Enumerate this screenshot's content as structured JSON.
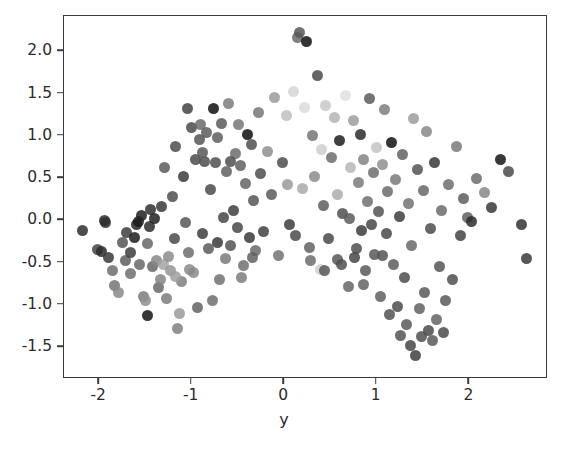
{
  "figure": {
    "background_color": "#ffffff",
    "axes_color": "#3b3b3b",
    "tick_text_color": "#2b2b2b"
  },
  "axes": {
    "xlabel": "y",
    "ylabel": "",
    "title": "",
    "x_ticks": [
      "-2",
      "-1",
      "0",
      "1",
      "2"
    ],
    "x_tick_values": [
      -2,
      -1,
      0,
      1,
      2
    ],
    "y_ticks": [
      "2.0",
      "1.5",
      "1.0",
      "0.5",
      "0.0",
      "-0.5",
      "-1.0",
      "-1.5"
    ],
    "y_tick_values": [
      2.0,
      1.5,
      1.0,
      0.5,
      0.0,
      -0.5,
      -1.0,
      -1.5
    ]
  },
  "chart_data": {
    "type": "scatter",
    "title": "",
    "xlabel": "y",
    "ylabel": "",
    "xlim": [
      -2.38,
      2.85
    ],
    "ylim": [
      -1.88,
      2.42
    ],
    "grid": false,
    "legend": null,
    "marker": {
      "shape": "circle",
      "size_px": 11,
      "colormap": "gray",
      "alpha": 0.85
    },
    "series": [
      {
        "name": "points",
        "points": [
          [
            -2.18,
            -0.12,
            "#2e2e2e"
          ],
          [
            -2.02,
            -0.35,
            "#444444"
          ],
          [
            -1.97,
            -0.37,
            "#2a2a2a"
          ],
          [
            -1.93,
            -0.03,
            "#303030"
          ],
          [
            -1.9,
            -0.44,
            "#3a3a3a"
          ],
          [
            -1.86,
            -0.6,
            "#6d6d6d"
          ],
          [
            -1.83,
            -0.77,
            "#767676"
          ],
          [
            -1.79,
            -0.86,
            "#8a8a8a"
          ],
          [
            -1.75,
            -0.26,
            "#555555"
          ],
          [
            -1.72,
            -0.48,
            "#5e5e5e"
          ],
          [
            -1.7,
            -0.14,
            "#3d3d3d"
          ],
          [
            -1.66,
            -0.63,
            "#707070"
          ],
          [
            -1.62,
            -0.2,
            "#1d1d1d"
          ],
          [
            -1.6,
            -0.05,
            "#262626"
          ],
          [
            -1.58,
            -0.02,
            "#1a1a1a"
          ],
          [
            -1.56,
            -0.52,
            "#686868"
          ],
          [
            -1.54,
            0.06,
            "#202020"
          ],
          [
            -1.52,
            -0.9,
            "#7d7d7d"
          ],
          [
            -1.5,
            -0.95,
            "#8f8f8f"
          ],
          [
            -1.48,
            -1.13,
            "#141414"
          ],
          [
            -1.46,
            -0.07,
            "#2c2c2c"
          ],
          [
            -1.44,
            0.13,
            "#2f2f2f"
          ],
          [
            -1.42,
            -0.55,
            "#676767"
          ],
          [
            -1.4,
            0.02,
            "#222222"
          ],
          [
            -1.38,
            -0.48,
            "#878787"
          ],
          [
            -1.36,
            -0.8,
            "#6a6a6a"
          ],
          [
            -1.33,
            0.16,
            "#393939"
          ],
          [
            -1.31,
            -0.52,
            "#a4a4a4"
          ],
          [
            -1.29,
            0.62,
            "#5a5a5a"
          ],
          [
            -1.27,
            -0.93,
            "#7b7b7b"
          ],
          [
            -1.25,
            -0.43,
            "#8d8d8d"
          ],
          [
            -1.23,
            -0.6,
            "#959595"
          ],
          [
            -1.21,
            0.28,
            "#4e4e4e"
          ],
          [
            -1.19,
            -0.22,
            "#4a4a4a"
          ],
          [
            -1.17,
            0.87,
            "#4d4d4d"
          ],
          [
            -1.15,
            -1.28,
            "#808080"
          ],
          [
            -1.13,
            -1.1,
            "#9a9a9a"
          ],
          [
            -1.11,
            -0.72,
            "#7f7f7f"
          ],
          [
            -1.09,
            0.52,
            "#3c3c3c"
          ],
          [
            -1.07,
            -0.03,
            "#575757"
          ],
          [
            -1.05,
            1.32,
            "#434343"
          ],
          [
            -1.03,
            -0.38,
            "#6f6f6f"
          ],
          [
            -1.0,
            1.1,
            "#4c4c4c"
          ],
          [
            -0.98,
            -0.62,
            "#8b8b8b"
          ],
          [
            -0.96,
            0.72,
            "#4b4b4b"
          ],
          [
            -0.94,
            -1.03,
            "#636363"
          ],
          [
            -0.92,
            0.96,
            "#565656"
          ],
          [
            -0.9,
            1.13,
            "#6b6b6b"
          ],
          [
            -0.88,
            -0.16,
            "#3e3e3e"
          ],
          [
            -0.86,
            0.7,
            "#4f4f4f"
          ],
          [
            -0.84,
            1.04,
            "#5d5d5d"
          ],
          [
            -0.82,
            -0.33,
            "#5c5c5c"
          ],
          [
            -0.8,
            0.37,
            "#4a4a4a"
          ],
          [
            -0.78,
            -0.95,
            "#6e6e6e"
          ],
          [
            -0.76,
            1.33,
            "#111111"
          ],
          [
            -0.74,
            0.69,
            "#515151"
          ],
          [
            -0.72,
            -0.26,
            "#3b3b3b"
          ],
          [
            -0.7,
            -0.7,
            "#727272"
          ],
          [
            -0.68,
            1.15,
            "#5b5b5b"
          ],
          [
            -0.66,
            0.03,
            "#474747"
          ],
          [
            -0.64,
            -0.45,
            "#7a7a7a"
          ],
          [
            -0.62,
            0.58,
            "#606060"
          ],
          [
            -0.6,
            1.38,
            "#7c7c7c"
          ],
          [
            -0.58,
            -0.3,
            "#545454"
          ],
          [
            -0.55,
            0.12,
            "#3f3f3f"
          ],
          [
            -0.53,
            0.79,
            "#6c6c6c"
          ],
          [
            -0.51,
            -0.08,
            "#484848"
          ],
          [
            -0.49,
            1.14,
            "#757575"
          ],
          [
            -0.47,
            0.65,
            "#5f5f5f"
          ],
          [
            -0.44,
            -0.53,
            "#717171"
          ],
          [
            -0.42,
            0.44,
            "#646464"
          ],
          [
            -0.4,
            1.02,
            "#0e0e0e"
          ],
          [
            -0.38,
            -0.2,
            "#3a3a3a"
          ],
          [
            -0.35,
            0.9,
            "#505050"
          ],
          [
            -0.33,
            0.24,
            "#565656"
          ],
          [
            -0.31,
            -0.36,
            "#6a6a6a"
          ],
          [
            -0.28,
            1.28,
            "#777777"
          ],
          [
            -0.26,
            0.55,
            "#4d4d4d"
          ],
          [
            -0.22,
            -0.13,
            "#424242"
          ],
          [
            -0.18,
            0.82,
            "#8e8e8e"
          ],
          [
            -0.14,
            0.3,
            "#5a5a5a"
          ],
          [
            -0.1,
            1.45,
            "#9b9b9b"
          ],
          [
            -0.06,
            -0.42,
            "#737373"
          ],
          [
            -0.02,
            0.68,
            "#4e4e4e"
          ],
          [
            0.02,
            1.24,
            "#c0c0c0"
          ],
          [
            0.06,
            -0.05,
            "#3d3d3d"
          ],
          [
            0.1,
            1.52,
            "#d6d6d6"
          ],
          [
            0.14,
            2.16,
            "#6b6b6b"
          ],
          [
            0.17,
            2.22,
            "#575757"
          ],
          [
            0.2,
            0.38,
            "#a9a9a9"
          ],
          [
            0.24,
            2.12,
            "#121212"
          ],
          [
            0.27,
            -0.32,
            "#636363"
          ],
          [
            0.3,
            1.0,
            "#757575"
          ],
          [
            0.33,
            0.52,
            "#8c8c8c"
          ],
          [
            0.36,
            1.72,
            "#4b4b4b"
          ],
          [
            0.39,
            -0.58,
            "#cfcfcf"
          ],
          [
            0.42,
            0.18,
            "#5e5e5e"
          ],
          [
            0.45,
            1.36,
            "#c8c8c8"
          ],
          [
            0.48,
            -0.22,
            "#4a4a4a"
          ],
          [
            0.51,
            0.74,
            "#6d6d6d"
          ],
          [
            0.54,
            1.22,
            "#b4b4b4"
          ],
          [
            0.57,
            -0.47,
            "#585858"
          ],
          [
            0.6,
            0.95,
            "#1f1f1f"
          ],
          [
            0.63,
            0.08,
            "#505050"
          ],
          [
            0.66,
            1.48,
            "#e0e0e0"
          ],
          [
            0.69,
            -0.78,
            "#666666"
          ],
          [
            0.72,
            0.62,
            "#b9b9b9"
          ],
          [
            0.75,
            1.18,
            "#9d9d9d"
          ],
          [
            0.78,
            -0.34,
            "#4f4f4f"
          ],
          [
            0.8,
            0.45,
            "#7b7b7b"
          ],
          [
            0.82,
            1.02,
            "#2b2b2b"
          ],
          [
            0.84,
            -0.12,
            "#3c3c3c"
          ],
          [
            0.86,
            0.72,
            "#848484"
          ],
          [
            0.88,
            -0.6,
            "#5b5b5b"
          ],
          [
            0.9,
            0.22,
            "#707070"
          ],
          [
            0.92,
            1.44,
            "#5c5c5c"
          ],
          [
            0.94,
            -0.05,
            "#464646"
          ],
          [
            0.96,
            0.57,
            "#6e6e6e"
          ],
          [
            0.98,
            -0.4,
            "#595959"
          ],
          [
            1.0,
            0.86,
            "#c3c3c3"
          ],
          [
            1.02,
            0.1,
            "#535353"
          ],
          [
            1.04,
            -0.9,
            "#5f5f5f"
          ],
          [
            1.06,
            0.66,
            "#8f8f8f"
          ],
          [
            1.08,
            1.31,
            "#7e7e7e"
          ],
          [
            1.1,
            -0.16,
            "#494949"
          ],
          [
            1.12,
            0.34,
            "#6b6b6b"
          ],
          [
            1.14,
            -1.12,
            "#525252"
          ],
          [
            1.16,
            0.92,
            "#111111"
          ],
          [
            1.18,
            -0.52,
            "#5d5d5d"
          ],
          [
            1.2,
            0.48,
            "#797979"
          ],
          [
            1.22,
            -1.02,
            "#4c4c4c"
          ],
          [
            1.24,
            0.04,
            "#3e3e3e"
          ],
          [
            1.26,
            -1.36,
            "#555555"
          ],
          [
            1.28,
            0.78,
            "#626262"
          ],
          [
            1.3,
            -0.68,
            "#4d4d4d"
          ],
          [
            1.32,
            -1.24,
            "#5a5a5a"
          ],
          [
            1.34,
            0.2,
            "#737373"
          ],
          [
            1.36,
            -1.48,
            "#474747"
          ],
          [
            1.38,
            -0.3,
            "#6a6a6a"
          ],
          [
            1.4,
            1.2,
            "#9c9c9c"
          ],
          [
            1.42,
            -1.6,
            "#3f3f3f"
          ],
          [
            1.44,
            0.6,
            "#545454"
          ],
          [
            1.46,
            -1.05,
            "#606060"
          ],
          [
            1.48,
            -1.38,
            "#515151"
          ],
          [
            1.5,
            0.35,
            "#676767"
          ],
          [
            1.52,
            -0.85,
            "#585858"
          ],
          [
            1.54,
            1.05,
            "#888888"
          ],
          [
            1.56,
            -1.3,
            "#4a4a4a"
          ],
          [
            1.58,
            -0.1,
            "#4e4e4e"
          ],
          [
            1.6,
            -1.42,
            "#5b5b5b"
          ],
          [
            1.62,
            0.68,
            "#383838"
          ],
          [
            1.64,
            -1.18,
            "#636363"
          ],
          [
            1.68,
            -0.55,
            "#565656"
          ],
          [
            1.7,
            0.12,
            "#6c6c6c"
          ],
          [
            1.72,
            -1.33,
            "#4b4b4b"
          ],
          [
            1.74,
            -0.95,
            "#595959"
          ],
          [
            1.78,
            0.42,
            "#6f6f6f"
          ],
          [
            1.82,
            -0.7,
            "#4f4f4f"
          ],
          [
            1.86,
            0.88,
            "#7a7a7a"
          ],
          [
            1.9,
            -0.18,
            "#444444"
          ],
          [
            1.94,
            0.26,
            "#5e5e5e"
          ],
          [
            1.98,
            0.03,
            "#616161"
          ],
          [
            2.02,
            -0.02,
            "#2d2d2d"
          ],
          [
            2.08,
            0.5,
            "#6d6d6d"
          ],
          [
            2.16,
            0.33,
            "#888888"
          ],
          [
            2.24,
            0.15,
            "#3a3a3a"
          ],
          [
            2.34,
            0.72,
            "#151515"
          ],
          [
            2.42,
            0.58,
            "#4c4c4c"
          ],
          [
            2.56,
            -0.05,
            "#333333"
          ],
          [
            2.62,
            -0.45,
            "#3b3b3b"
          ],
          [
            -1.94,
            0.0,
            "#2e2e2e"
          ],
          [
            -1.66,
            -0.38,
            "#3c3c3c"
          ],
          [
            -1.48,
            -0.28,
            "#696969"
          ],
          [
            -1.34,
            -0.7,
            "#848484"
          ],
          [
            -1.18,
            -0.66,
            "#9f9f9f"
          ],
          [
            -1.02,
            -0.58,
            "#8a8a8a"
          ],
          [
            -0.88,
            0.8,
            "#595959"
          ],
          [
            -0.72,
            0.98,
            "#5f5f5f"
          ],
          [
            -0.58,
            0.7,
            "#4f4f4f"
          ],
          [
            -0.46,
            -0.68,
            "#7c7c7c"
          ],
          [
            -0.34,
            -0.44,
            "#626262"
          ],
          [
            0.12,
            -0.18,
            "#4b4b4b"
          ],
          [
            0.28,
            -0.48,
            "#6d6d6d"
          ],
          [
            0.44,
            -0.6,
            "#585858"
          ],
          [
            0.62,
            -0.52,
            "#505050"
          ],
          [
            0.76,
            -0.44,
            "#474747"
          ],
          [
            0.7,
            0.02,
            "#5c5c5c"
          ],
          [
            0.86,
            -0.76,
            "#636363"
          ],
          [
            1.06,
            -0.42,
            "#545454"
          ],
          [
            0.58,
            0.3,
            "#adadad"
          ],
          [
            0.4,
            0.84,
            "#cfcfcf"
          ],
          [
            0.22,
            1.34,
            "#dadada"
          ],
          [
            0.04,
            0.42,
            "#9a9a9a"
          ]
        ]
      }
    ]
  }
}
